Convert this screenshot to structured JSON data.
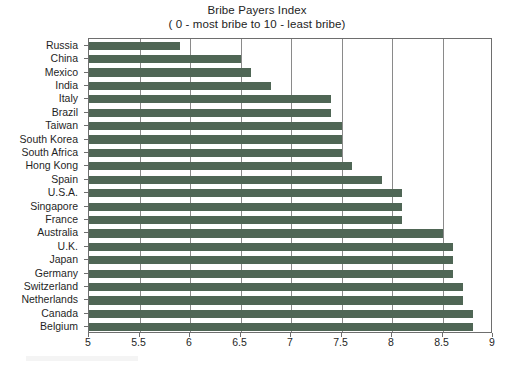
{
  "chart_data": {
    "type": "bar",
    "orientation": "horizontal",
    "title": "Bribe Payers Index",
    "subtitle": "( 0 - most bribe to 10 - least bribe)",
    "xlabel": "",
    "ylabel": "",
    "xlim": [
      5,
      9
    ],
    "ylim": null,
    "grid": true,
    "legend": null,
    "bar_color": "#4f6655",
    "xticks": [
      "5",
      "5.5",
      "6",
      "6.5",
      "7",
      "7.5",
      "8",
      "8.5",
      "9"
    ],
    "xtick_values": [
      5,
      5.5,
      6,
      6.5,
      7,
      7.5,
      8,
      8.5,
      9
    ],
    "categories": [
      "Russia",
      "China",
      "Mexico",
      "India",
      "Italy",
      "Brazil",
      "Taiwan",
      "South Korea",
      "South Africa",
      "Hong Kong",
      "Spain",
      "U.S.A.",
      "Singapore",
      "France",
      "Australia",
      "U.K.",
      "Japan",
      "Germany",
      "Switzerland",
      "Netherlands",
      "Canada",
      "Belgium"
    ],
    "values": [
      5.9,
      6.5,
      6.6,
      6.8,
      7.4,
      7.4,
      7.5,
      7.5,
      7.5,
      7.6,
      7.9,
      8.1,
      8.1,
      8.1,
      8.5,
      8.6,
      8.6,
      8.6,
      8.7,
      8.7,
      8.8,
      8.8
    ]
  }
}
